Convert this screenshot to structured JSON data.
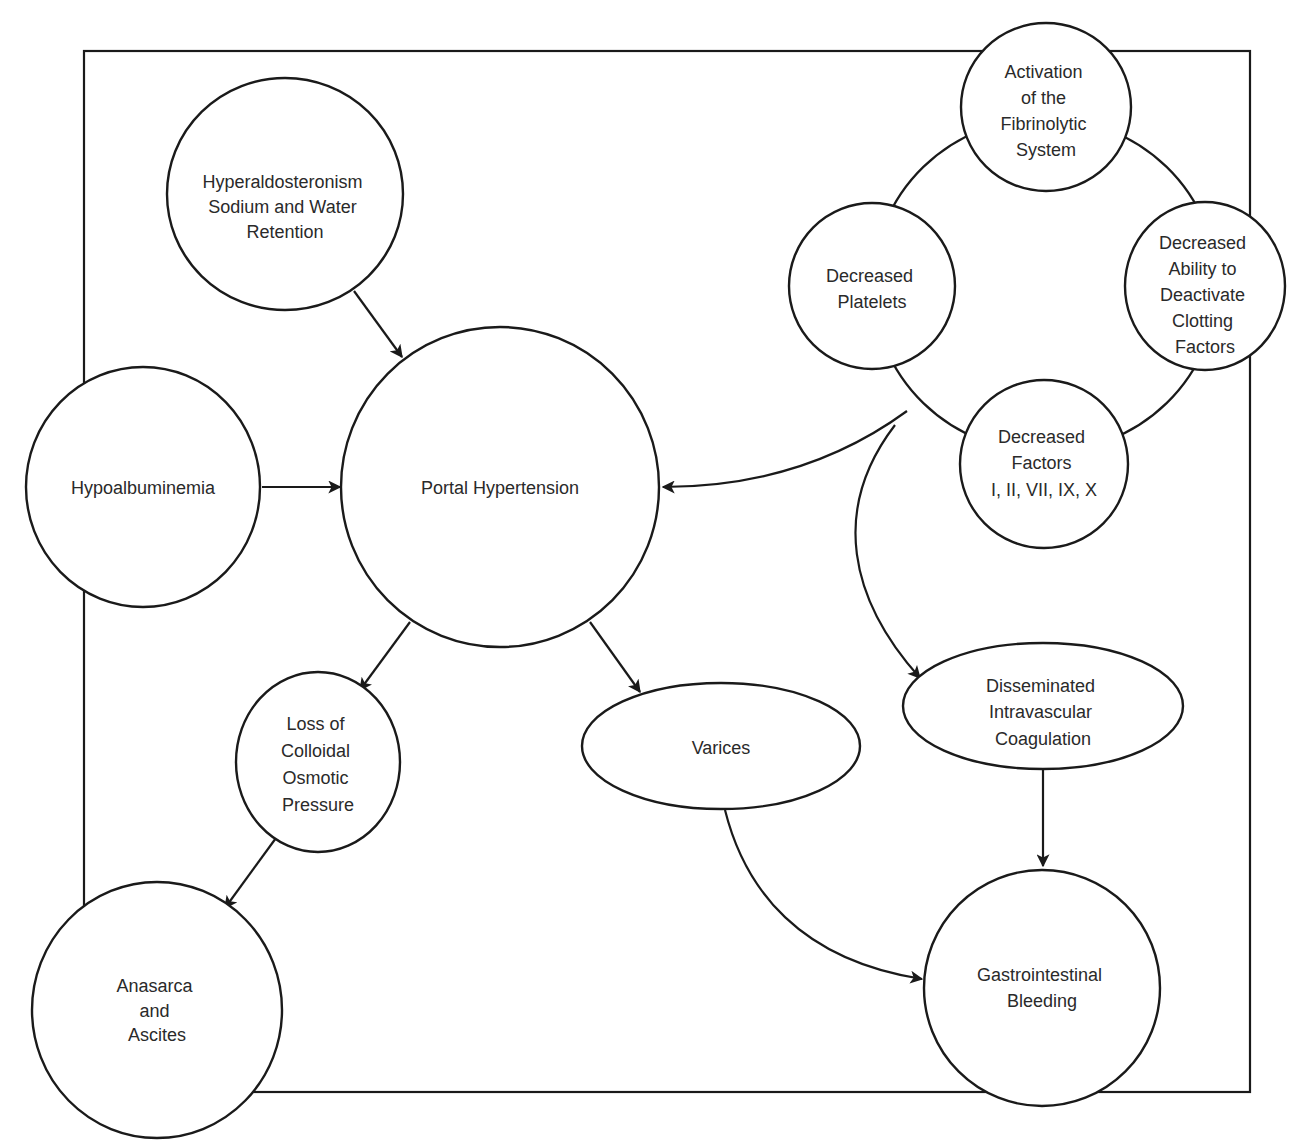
{
  "diagram": {
    "type": "concept-map",
    "colors": {
      "stroke": "#1a1a1a",
      "text": "#2a2a2a",
      "background": "#ffffff"
    },
    "nodes": {
      "hyperaldosteronism": {
        "lines": [
          "Hyperaldosteronism",
          "Sodium and Water",
          "Retention"
        ]
      },
      "hypoalbuminemia": {
        "lines": [
          "Hypoalbuminemia"
        ]
      },
      "portal_hypertension": {
        "lines": [
          "Portal Hypertension"
        ]
      },
      "loss_colloidal": {
        "lines": [
          "Loss of",
          "Colloidal",
          "Osmotic",
          "Pressure"
        ]
      },
      "anasarca": {
        "lines": [
          "Anasarca",
          "and",
          "Ascites"
        ]
      },
      "varices": {
        "lines": [
          "Varices"
        ]
      },
      "activation_fibrinolytic": {
        "lines": [
          "Activation",
          "of the",
          "Fibrinolytic",
          "System"
        ]
      },
      "decreased_platelets": {
        "lines": [
          "Decreased",
          "Platelets"
        ]
      },
      "decreased_ability": {
        "lines": [
          "Decreased",
          "Ability to",
          "Deactivate",
          "Clotting",
          "Factors"
        ]
      },
      "decreased_factors": {
        "lines": [
          "Decreased",
          "Factors",
          "I, II, VII, IX, X"
        ]
      },
      "dic": {
        "lines": [
          "Disseminated",
          "Intravascular",
          "Coagulation"
        ]
      },
      "gi_bleeding": {
        "lines": [
          "Gastrointestinal",
          "Bleeding"
        ]
      }
    },
    "edges": [
      {
        "from": "Hyperaldosteronism Sodium and Water Retention",
        "to": "Portal Hypertension"
      },
      {
        "from": "Hypoalbuminemia",
        "to": "Portal Hypertension"
      },
      {
        "from": "Coagulopathy cluster",
        "to": "Portal Hypertension"
      },
      {
        "from": "Portal Hypertension",
        "to": "Loss of Colloidal Osmotic Pressure"
      },
      {
        "from": "Portal Hypertension",
        "to": "Varices"
      },
      {
        "from": "Loss of Colloidal Osmotic Pressure",
        "to": "Anasarca and Ascites"
      },
      {
        "from": "Coagulopathy cluster",
        "to": "Disseminated Intravascular Coagulation"
      },
      {
        "from": "Disseminated Intravascular Coagulation",
        "to": "Gastrointestinal Bleeding"
      },
      {
        "from": "Varices",
        "to": "Gastrointestinal Bleeding"
      }
    ]
  }
}
